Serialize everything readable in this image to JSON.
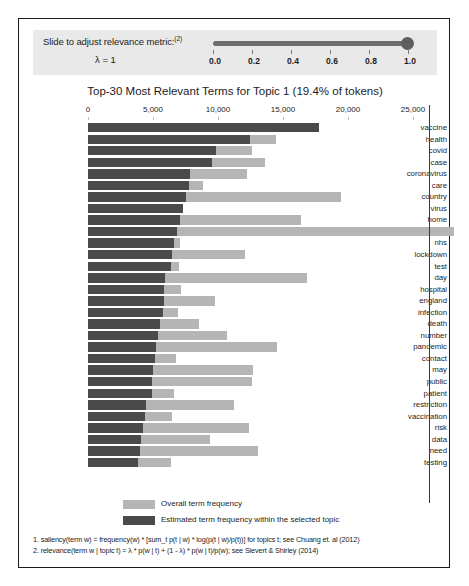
{
  "slider": {
    "label": "Slide to adjust relevance metric:",
    "label_superscript": "(2)",
    "lambda_display": "λ = 1",
    "value": 1.0,
    "min": 0.0,
    "max": 1.0,
    "ticks": [
      "0.0",
      "0.2",
      "0.4",
      "0.6",
      "0.8",
      "1.0"
    ]
  },
  "legend": {
    "items": [
      {
        "swatch": "light",
        "label": "Overall term frequency"
      },
      {
        "swatch": "dark",
        "label": "Estimated term frequency within the selected topic"
      }
    ]
  },
  "footnotes": [
    "1. saliency(term w) = frequency(w) * [sum_t p(t | w) * log(p(t | w)/p(t))] for topics t; see Chuang et. al (2012)",
    "2. relevance(term w | topic t) = λ * p(w | t) + (1 - λ) * p(w | t)/p(w); see Sievert & Shirley (2014)"
  ],
  "colors": {
    "overall_bar": "#b5b5b5",
    "topic_bar": "#4a4a4a",
    "slider_track": "#6e6e6e",
    "slider_strip": "#e9e9e9",
    "panel_border": "#1b1b1b"
  },
  "chart_data": {
    "type": "bar",
    "orientation": "horizontal",
    "title": "Top-30 Most Relevant Terms for Topic 1 (19.4% of tokens)",
    "topic_number": 1,
    "topic_token_share": "19.4%",
    "xlabel": "",
    "ylabel": "",
    "xlim": [
      0,
      27000
    ],
    "xticks": [
      0,
      5000,
      10000,
      15000,
      20000,
      25000
    ],
    "xtick_labels": [
      "0",
      "5,000",
      "10,000",
      "15,000",
      "20,000",
      "25,000"
    ],
    "grid": false,
    "legend_position": "bottom",
    "categories": [
      "vaccine",
      "health",
      "covid",
      "case",
      "coronavirus",
      "care",
      "country",
      "virus",
      "home",
      "uk",
      "nhs",
      "lockdown",
      "test",
      "day",
      "hospital",
      "england",
      "infection",
      "death",
      "number",
      "pandemic",
      "contact",
      "may",
      "public",
      "patient",
      "restriction",
      "vaccination",
      "risk",
      "data",
      "need",
      "testing"
    ],
    "series": [
      {
        "name": "Overall term frequency",
        "color": "#b5b5b5",
        "values": [
          17800,
          14450,
          12600,
          13650,
          12200,
          8850,
          19450,
          7300,
          16350,
          28150,
          7050,
          12050,
          7000,
          16850,
          7150,
          9750,
          6950,
          8550,
          10700,
          14550,
          6800,
          12700,
          12600,
          6650,
          11200,
          6450,
          12350,
          9350,
          13050,
          6350
        ]
      },
      {
        "name": "Estimated term frequency within the selected topic",
        "color": "#4a4a4a",
        "values": [
          17800,
          12450,
          9850,
          9500,
          7850,
          7750,
          7550,
          7300,
          7100,
          6850,
          6600,
          6450,
          6400,
          5900,
          5850,
          5850,
          5750,
          5550,
          5400,
          5250,
          5150,
          5000,
          4950,
          4900,
          4450,
          4400,
          4250,
          4100,
          4000,
          3850
        ]
      }
    ]
  }
}
